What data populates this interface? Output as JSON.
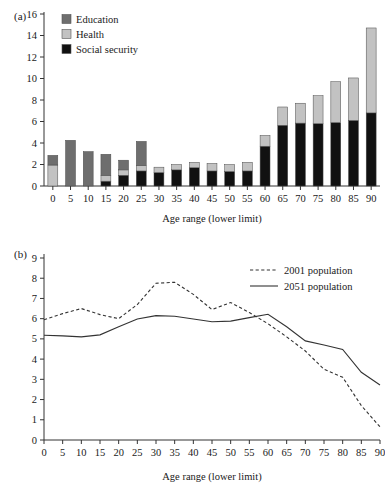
{
  "figure": {
    "panel_a_label": "(a)",
    "panel_b_label": "(b)"
  },
  "chart_data": [
    {
      "id": "panel-a",
      "type": "bar",
      "stacked": true,
      "title": "",
      "xlabel": "Age range (lower limit)",
      "ylabel": "",
      "ylim": [
        0,
        16
      ],
      "ytick_step": 2,
      "yticks": [
        0,
        2,
        4,
        6,
        8,
        10,
        12,
        14,
        16
      ],
      "grid": false,
      "legend_position": "top-left",
      "categories": [
        "0",
        "5",
        "10",
        "15",
        "20",
        "25",
        "30",
        "35",
        "40",
        "45",
        "50",
        "55",
        "60",
        "65",
        "70",
        "75",
        "80",
        "85",
        "90"
      ],
      "series": [
        {
          "name": "Social security",
          "color": "#111111",
          "values": [
            0.0,
            0.0,
            0.0,
            0.45,
            1.0,
            1.4,
            1.25,
            1.5,
            1.7,
            1.4,
            1.35,
            1.4,
            3.7,
            5.65,
            5.85,
            5.8,
            5.9,
            6.1,
            6.8
          ]
        },
        {
          "name": "Health",
          "color": "#c2c2c2",
          "values": [
            1.95,
            0.0,
            0.0,
            0.55,
            0.5,
            0.5,
            0.5,
            0.5,
            0.5,
            0.7,
            0.65,
            0.8,
            1.0,
            1.7,
            1.85,
            2.6,
            3.8,
            3.95,
            7.9
          ]
        },
        {
          "name": "Education",
          "color": "#6e6e6e",
          "values": [
            0.9,
            4.25,
            3.2,
            1.95,
            0.9,
            2.25,
            0.0,
            0.0,
            0.0,
            0.0,
            0.0,
            0.0,
            0.0,
            0.0,
            0.0,
            0.0,
            0.0,
            0.0,
            0.0
          ]
        }
      ],
      "totals": [
        2.85,
        4.25,
        3.2,
        2.95,
        2.4,
        4.15,
        1.75,
        2.0,
        2.2,
        2.1,
        2.0,
        2.2,
        4.7,
        7.35,
        7.7,
        8.4,
        9.7,
        10.05,
        14.7
      ],
      "legend": [
        {
          "label": "Education",
          "color": "#6e6e6e"
        },
        {
          "label": "Health",
          "color": "#c2c2c2"
        },
        {
          "label": "Social security",
          "color": "#111111"
        }
      ]
    },
    {
      "id": "panel-b",
      "type": "line",
      "title": "",
      "xlabel": "Age range (lower limit)",
      "ylabel": "",
      "ylim": [
        0,
        9
      ],
      "ytick_step": 1,
      "yticks": [
        0,
        1,
        2,
        3,
        4,
        5,
        6,
        7,
        8,
        9
      ],
      "grid": false,
      "legend_position": "top-right",
      "x": [
        0,
        5,
        10,
        15,
        20,
        25,
        30,
        35,
        40,
        45,
        50,
        55,
        60,
        65,
        70,
        75,
        80,
        85,
        90
      ],
      "series": [
        {
          "name": "2001 population",
          "style": "dashed",
          "color": "#333333",
          "values": [
            5.95,
            6.25,
            6.5,
            6.2,
            6.0,
            6.7,
            7.75,
            7.8,
            7.2,
            6.45,
            6.8,
            6.3,
            5.75,
            5.1,
            4.4,
            3.5,
            3.1,
            1.7,
            0.65
          ]
        },
        {
          "name": "2051 population",
          "style": "solid",
          "color": "#333333",
          "values": [
            5.18,
            5.15,
            5.1,
            5.2,
            5.6,
            5.98,
            6.15,
            6.12,
            5.98,
            5.85,
            5.88,
            6.05,
            6.22,
            5.6,
            4.9,
            4.7,
            4.48,
            3.35,
            2.72
          ]
        }
      ]
    }
  ]
}
